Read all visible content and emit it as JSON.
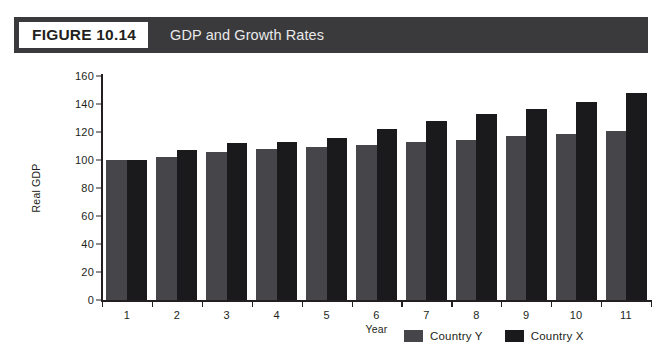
{
  "header": {
    "tag": "FIGURE 10.14",
    "title": "GDP and Growth Rates",
    "bar_color": "#3a3a3c",
    "tag_bg": "#ffffff"
  },
  "chart_data": {
    "type": "bar",
    "title": "GDP and Growth Rates",
    "xlabel": "Year",
    "ylabel": "Real GDP",
    "categories": [
      "1",
      "2",
      "3",
      "4",
      "5",
      "6",
      "7",
      "8",
      "9",
      "10",
      "11"
    ],
    "ylim": [
      0,
      160
    ],
    "yticks": [
      0,
      20,
      40,
      60,
      80,
      100,
      120,
      140,
      160
    ],
    "grid": false,
    "legend_position": "bottom-right",
    "series": [
      {
        "name": "Country Y",
        "color": "#45454a",
        "values": [
          100,
          102,
          106,
          108,
          109,
          111,
          113,
          114,
          117,
          118.5,
          121
        ]
      },
      {
        "name": "Country X",
        "color": "#1a1a1c",
        "values": [
          100,
          107,
          112,
          113,
          116,
          122,
          128,
          133,
          136.5,
          141.5,
          148
        ]
      }
    ]
  }
}
